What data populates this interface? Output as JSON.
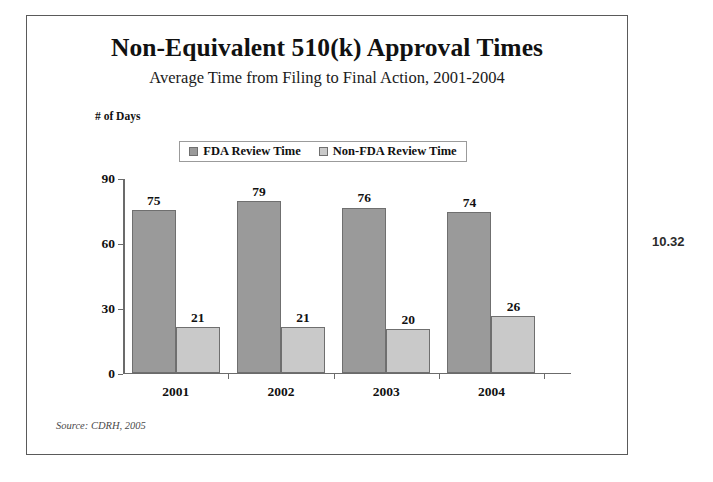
{
  "page_number": "10.32",
  "source_note": "Source: CDRH, 2005",
  "chart_data": {
    "type": "bar",
    "title": "Non-Equivalent 510(k) Approval Times",
    "subtitle": "Average Time from Filing to Final Action, 2001-2004",
    "xlabel": "",
    "ylabel": "# of Days",
    "categories": [
      "2001",
      "2002",
      "2003",
      "2004"
    ],
    "series": [
      {
        "name": "FDA Review Time",
        "color": "#9a9a9a",
        "values": [
          75,
          79,
          76,
          74
        ]
      },
      {
        "name": "Non-FDA Review Time",
        "color": "#c9c9c9",
        "values": [
          21,
          21,
          20,
          26
        ]
      }
    ],
    "ylim": [
      0,
      90
    ],
    "yticks": [
      0,
      30,
      60,
      90
    ],
    "ytick_labels": [
      "0",
      "30",
      "60",
      "90"
    ],
    "grid": false,
    "legend_position": "top-center",
    "data_labels": true
  }
}
